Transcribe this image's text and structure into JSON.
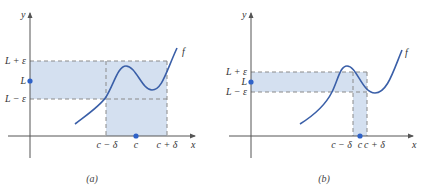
{
  "colors": {
    "shade": "#d4e0f0",
    "curve": "#3a5fa8",
    "axis": "#555555",
    "dash": "#8a8a8a",
    "dot": "#2e62c8",
    "text": "#333333"
  },
  "panels": [
    {
      "id": "a",
      "caption": "(a)",
      "axis_x_label": "x",
      "axis_y_label": "y",
      "curve_label": "f",
      "y_labels": {
        "upper": "L + ε",
        "middle": "L",
        "lower": "L − ε"
      },
      "x_labels": {
        "left": "c − δ",
        "center": "c",
        "right": "c + δ"
      }
    },
    {
      "id": "b",
      "caption": "(b)",
      "axis_x_label": "x",
      "axis_y_label": "y",
      "curve_label": "f",
      "y_labels": {
        "upper": "L + ε",
        "middle": "L",
        "lower": "L − ε"
      },
      "x_labels": {
        "left": "c − δ",
        "center": "c",
        "right": "c + δ"
      }
    }
  ]
}
